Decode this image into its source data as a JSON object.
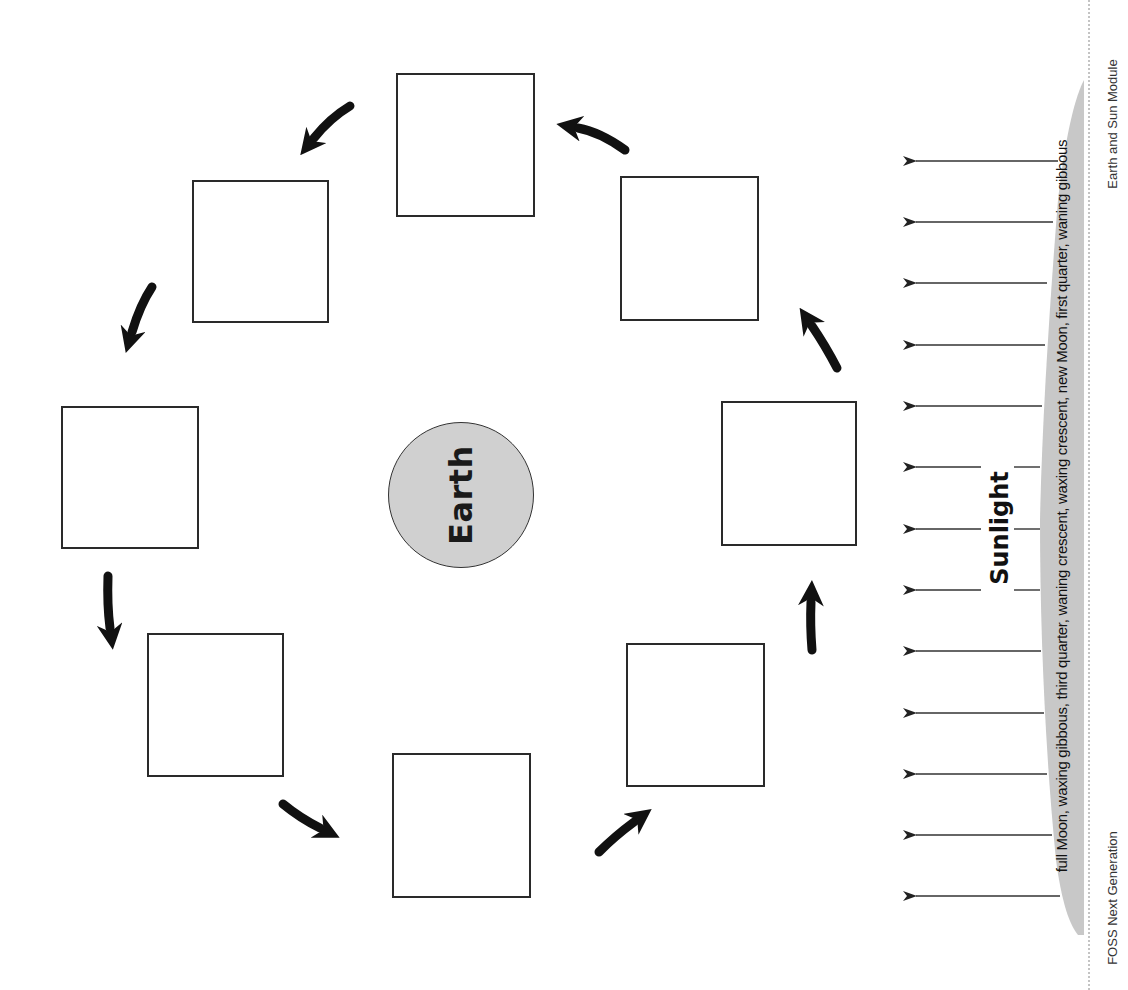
{
  "diagram": {
    "center_label": "Earth",
    "light_label": "Sunlight",
    "answer_bank": "full Moon, waxing gibbous, third quarter, waning crescent, waxing crescent, new Moon, first quarter, waning gibbous",
    "phase_boxes": [
      {
        "position": "top",
        "content": ""
      },
      {
        "position": "upper-left",
        "content": ""
      },
      {
        "position": "left",
        "content": ""
      },
      {
        "position": "lower-left",
        "content": ""
      },
      {
        "position": "bottom",
        "content": ""
      },
      {
        "position": "lower-right",
        "content": ""
      },
      {
        "position": "right",
        "content": ""
      },
      {
        "position": "upper-right",
        "content": ""
      }
    ],
    "orbit_direction": "counterclockwise",
    "sunlight_arrow_count": 13,
    "colors": {
      "earth_fill": "#d0d0d0",
      "wedge_fill": "#c8c8c8",
      "stroke": "#2a2a2a"
    }
  },
  "footer": {
    "left": "FOSS Next Generation",
    "right": "Earth and Sun Module"
  }
}
